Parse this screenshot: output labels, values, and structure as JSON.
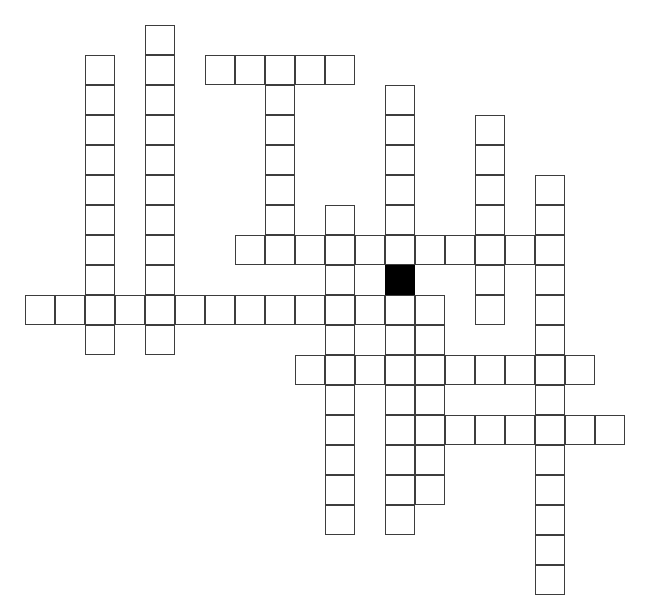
{
  "page": {
    "title": "",
    "caption": "",
    "background_color": "#ffffff",
    "width": 654,
    "height": 609
  },
  "grid": {
    "origin_x": 25,
    "origin_y": 25,
    "cell_size": 30,
    "columns": 21,
    "rows": 19,
    "line_color": "#3d3d3d",
    "line_width": 1.4,
    "cell_fill": "#ffffff",
    "block_fill": "#000000",
    "total_open_cells": 119,
    "total_block_cells": 1,
    "blocks": [
      {
        "col": 12,
        "row": 8
      }
    ],
    "entries": [
      {
        "id": "down-a",
        "direction": "down",
        "col": 2,
        "row": 1,
        "length": 10
      },
      {
        "id": "down-b",
        "direction": "down",
        "col": 4,
        "row": 0,
        "length": 11
      },
      {
        "id": "across-a",
        "direction": "across",
        "col": 6,
        "row": 1,
        "length": 5
      },
      {
        "id": "down-c",
        "direction": "down",
        "col": 8,
        "row": 1,
        "length": 6
      },
      {
        "id": "down-d",
        "direction": "down",
        "col": 10,
        "row": 6,
        "length": 11
      },
      {
        "id": "down-e",
        "direction": "down",
        "col": 12,
        "row": 2,
        "length": 12
      },
      {
        "id": "down-f",
        "direction": "down",
        "col": 15,
        "row": 3,
        "length": 7
      },
      {
        "id": "down-g",
        "direction": "down",
        "col": 17,
        "row": 5,
        "length": 14
      },
      {
        "id": "across-b",
        "direction": "across",
        "col": 7,
        "row": 7,
        "length": 9
      },
      {
        "id": "across-c",
        "direction": "across",
        "col": 0,
        "row": 9,
        "length": 12
      },
      {
        "id": "across-d",
        "direction": "across",
        "col": 13,
        "row": 9,
        "length": 1
      },
      {
        "id": "down-h",
        "direction": "down",
        "col": 13,
        "row": 9,
        "length": 7
      },
      {
        "id": "across-e",
        "direction": "across",
        "col": 9,
        "row": 11,
        "length": 10
      },
      {
        "id": "across-f",
        "direction": "across",
        "col": 12,
        "row": 13,
        "length": 8
      }
    ],
    "cells": [
      {
        "col": 2,
        "row": 1
      },
      {
        "col": 2,
        "row": 2
      },
      {
        "col": 2,
        "row": 3
      },
      {
        "col": 2,
        "row": 4
      },
      {
        "col": 2,
        "row": 5
      },
      {
        "col": 2,
        "row": 6
      },
      {
        "col": 2,
        "row": 7
      },
      {
        "col": 2,
        "row": 8
      },
      {
        "col": 2,
        "row": 9
      },
      {
        "col": 2,
        "row": 10
      },
      {
        "col": 4,
        "row": 0
      },
      {
        "col": 4,
        "row": 1
      },
      {
        "col": 4,
        "row": 2
      },
      {
        "col": 4,
        "row": 3
      },
      {
        "col": 4,
        "row": 4
      },
      {
        "col": 4,
        "row": 5
      },
      {
        "col": 4,
        "row": 6
      },
      {
        "col": 4,
        "row": 7
      },
      {
        "col": 4,
        "row": 8
      },
      {
        "col": 4,
        "row": 9
      },
      {
        "col": 4,
        "row": 10
      },
      {
        "col": 6,
        "row": 1
      },
      {
        "col": 7,
        "row": 1
      },
      {
        "col": 8,
        "row": 1
      },
      {
        "col": 9,
        "row": 1
      },
      {
        "col": 10,
        "row": 1
      },
      {
        "col": 8,
        "row": 2
      },
      {
        "col": 8,
        "row": 3
      },
      {
        "col": 8,
        "row": 4
      },
      {
        "col": 8,
        "row": 5
      },
      {
        "col": 8,
        "row": 6
      },
      {
        "col": 10,
        "row": 6
      },
      {
        "col": 10,
        "row": 7
      },
      {
        "col": 10,
        "row": 8
      },
      {
        "col": 10,
        "row": 9
      },
      {
        "col": 10,
        "row": 10
      },
      {
        "col": 10,
        "row": 11
      },
      {
        "col": 10,
        "row": 12
      },
      {
        "col": 10,
        "row": 13
      },
      {
        "col": 10,
        "row": 14
      },
      {
        "col": 10,
        "row": 15
      },
      {
        "col": 10,
        "row": 16
      },
      {
        "col": 12,
        "row": 2
      },
      {
        "col": 12,
        "row": 3
      },
      {
        "col": 12,
        "row": 4
      },
      {
        "col": 12,
        "row": 5
      },
      {
        "col": 12,
        "row": 6
      },
      {
        "col": 12,
        "row": 7
      },
      {
        "col": 12,
        "row": 9
      },
      {
        "col": 12,
        "row": 10
      },
      {
        "col": 12,
        "row": 11
      },
      {
        "col": 12,
        "row": 12
      },
      {
        "col": 12,
        "row": 13
      },
      {
        "col": 15,
        "row": 3
      },
      {
        "col": 15,
        "row": 4
      },
      {
        "col": 15,
        "row": 5
      },
      {
        "col": 15,
        "row": 6
      },
      {
        "col": 15,
        "row": 7
      },
      {
        "col": 15,
        "row": 8
      },
      {
        "col": 15,
        "row": 9
      },
      {
        "col": 17,
        "row": 5
      },
      {
        "col": 17,
        "row": 6
      },
      {
        "col": 17,
        "row": 7
      },
      {
        "col": 17,
        "row": 8
      },
      {
        "col": 17,
        "row": 9
      },
      {
        "col": 17,
        "row": 10
      },
      {
        "col": 17,
        "row": 11
      },
      {
        "col": 17,
        "row": 12
      },
      {
        "col": 17,
        "row": 13
      },
      {
        "col": 17,
        "row": 14
      },
      {
        "col": 17,
        "row": 15
      },
      {
        "col": 17,
        "row": 16
      },
      {
        "col": 17,
        "row": 17
      },
      {
        "col": 17,
        "row": 18
      },
      {
        "col": 7,
        "row": 7
      },
      {
        "col": 8,
        "row": 7
      },
      {
        "col": 9,
        "row": 7
      },
      {
        "col": 11,
        "row": 7
      },
      {
        "col": 13,
        "row": 7
      },
      {
        "col": 14,
        "row": 7
      },
      {
        "col": 16,
        "row": 7
      },
      {
        "col": 0,
        "row": 9
      },
      {
        "col": 1,
        "row": 9
      },
      {
        "col": 3,
        "row": 9
      },
      {
        "col": 5,
        "row": 9
      },
      {
        "col": 6,
        "row": 9
      },
      {
        "col": 7,
        "row": 9
      },
      {
        "col": 8,
        "row": 9
      },
      {
        "col": 9,
        "row": 9
      },
      {
        "col": 11,
        "row": 9
      },
      {
        "col": 13,
        "row": 9
      },
      {
        "col": 13,
        "row": 10
      },
      {
        "col": 13,
        "row": 11
      },
      {
        "col": 13,
        "row": 12
      },
      {
        "col": 13,
        "row": 13
      },
      {
        "col": 13,
        "row": 14
      },
      {
        "col": 13,
        "row": 15
      },
      {
        "col": 9,
        "row": 11
      },
      {
        "col": 11,
        "row": 11
      },
      {
        "col": 14,
        "row": 11
      },
      {
        "col": 15,
        "row": 11
      },
      {
        "col": 16,
        "row": 11
      },
      {
        "col": 18,
        "row": 11
      },
      {
        "col": 12,
        "row": 14
      },
      {
        "col": 12,
        "row": 15
      },
      {
        "col": 12,
        "row": 16
      },
      {
        "col": 14,
        "row": 13
      },
      {
        "col": 15,
        "row": 13
      },
      {
        "col": 16,
        "row": 13
      },
      {
        "col": 18,
        "row": 13
      },
      {
        "col": 19,
        "row": 13
      }
    ]
  }
}
